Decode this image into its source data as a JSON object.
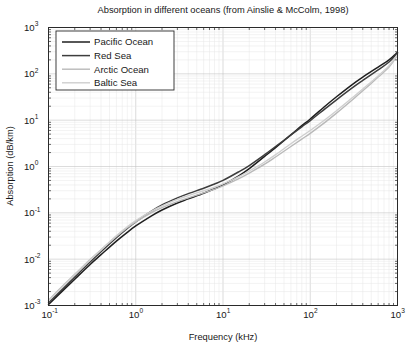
{
  "chart_data": {
    "type": "line",
    "title": "Absorption in different oceans (from Ainslie & McColm, 1998)",
    "xlabel": "Frequency (kHz)",
    "ylabel": "Absorption (dB/km)",
    "xscale": "log",
    "yscale": "log",
    "xlim": [
      0.1,
      1000
    ],
    "ylim": [
      0.001,
      1000
    ],
    "xticks": [
      "10",
      "10",
      "10",
      "10",
      "10"
    ],
    "xtick_exponents": [
      "-1",
      "0",
      "1",
      "2",
      "3"
    ],
    "yticks": [
      "10",
      "10",
      "10",
      "10",
      "10",
      "10",
      "10"
    ],
    "ytick_exponents": [
      "-3",
      "-2",
      "-1",
      "0",
      "1",
      "2",
      "3"
    ],
    "grid": true,
    "legend_position": "upper left",
    "series": [
      {
        "name": "Pacific Ocean",
        "color": "#1f1f1f",
        "width": 1.5,
        "x": [
          0.1,
          0.15,
          0.2,
          0.3,
          0.4,
          0.6,
          0.8,
          1.0,
          1.5,
          2.0,
          3.0,
          4.0,
          6.0,
          8.0,
          10,
          15,
          20,
          30,
          40,
          60,
          80,
          100,
          150,
          200,
          300,
          400,
          600,
          800,
          1000
        ],
        "y": [
          0.00105,
          0.0022,
          0.0037,
          0.0077,
          0.0125,
          0.0245,
          0.038,
          0.052,
          0.085,
          0.115,
          0.163,
          0.2,
          0.265,
          0.33,
          0.4,
          0.62,
          0.9,
          1.65,
          2.55,
          4.8,
          7.6,
          10.6,
          20.5,
          32,
          58,
          85,
          140,
          200,
          290
        ]
      },
      {
        "name": "Red Sea",
        "color": "#3d3d3d",
        "width": 1.5,
        "x": [
          0.1,
          0.15,
          0.2,
          0.3,
          0.4,
          0.6,
          0.8,
          1.0,
          1.5,
          2.0,
          3.0,
          4.0,
          6.0,
          8.0,
          10,
          15,
          20,
          30,
          40,
          60,
          80,
          100,
          150,
          200,
          300,
          400,
          600,
          800,
          1000
        ],
        "y": [
          0.00115,
          0.0024,
          0.0041,
          0.0087,
          0.0145,
          0.029,
          0.046,
          0.064,
          0.108,
          0.148,
          0.21,
          0.26,
          0.34,
          0.42,
          0.5,
          0.76,
          1.05,
          1.8,
          2.7,
          4.8,
          7.2,
          9.8,
          18,
          27.5,
          49,
          72,
          122,
          180,
          280
        ]
      },
      {
        "name": "Arctic Ocean",
        "color": "#b9b9b9",
        "width": 1.4,
        "x": [
          0.1,
          0.15,
          0.2,
          0.3,
          0.4,
          0.6,
          0.8,
          1.0,
          1.5,
          2.0,
          3.0,
          4.0,
          6.0,
          8.0,
          10,
          15,
          20,
          30,
          40,
          60,
          80,
          100,
          150,
          200,
          300,
          400,
          600,
          800,
          1000
        ],
        "y": [
          0.0013,
          0.0028,
          0.0047,
          0.0098,
          0.016,
          0.031,
          0.048,
          0.064,
          0.1,
          0.13,
          0.175,
          0.21,
          0.27,
          0.325,
          0.38,
          0.54,
          0.72,
          1.12,
          1.6,
          2.7,
          3.9,
          5.2,
          9.2,
          14.2,
          27,
          43,
          85,
          140,
          250
        ]
      },
      {
        "name": "Baltic Sea",
        "color": "#cfcfcf",
        "width": 1.4,
        "x": [
          0.1,
          0.15,
          0.2,
          0.3,
          0.4,
          0.6,
          0.8,
          1.0,
          1.5,
          2.0,
          3.0,
          4.0,
          6.0,
          8.0,
          10,
          15,
          20,
          30,
          40,
          60,
          80,
          100,
          150,
          200,
          300,
          400,
          600,
          800,
          1000
        ],
        "y": [
          0.00125,
          0.0027,
          0.0046,
          0.0096,
          0.0158,
          0.032,
          0.05,
          0.068,
          0.108,
          0.142,
          0.195,
          0.235,
          0.3,
          0.36,
          0.42,
          0.6,
          0.8,
          1.25,
          1.8,
          3.1,
          4.5,
          6.0,
          10.5,
          16,
          30,
          47,
          90,
          150,
          260
        ]
      }
    ]
  },
  "legend": {
    "items": [
      "Pacific Ocean",
      "Red Sea",
      "Arctic Ocean",
      "Baltic Sea"
    ]
  }
}
